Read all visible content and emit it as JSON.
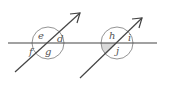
{
  "diagram": {
    "type": "angles-parallel-lines",
    "colors": {
      "line": "#444444",
      "circle": "#888888",
      "shade": "#d9d9d9",
      "label": "#555555"
    },
    "left_intersection": {
      "labels": {
        "top": "e",
        "right": "d",
        "left": "f",
        "bottom": "g"
      }
    },
    "right_intersection": {
      "labels": {
        "top": "h",
        "right": "i",
        "bottom": "j"
      },
      "shaded_angle": "bottom-left"
    }
  }
}
